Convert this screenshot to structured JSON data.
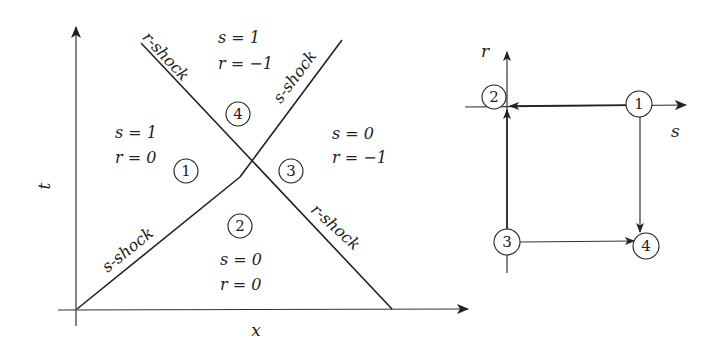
{
  "left_diagram": {
    "axes": {
      "x_label": "x",
      "y_label": "t"
    },
    "shocks": [
      {
        "label": "r-shock",
        "position": "upper-left"
      },
      {
        "label": "s-shock",
        "position": "upper-right"
      },
      {
        "label": "s-shock",
        "position": "lower-left"
      },
      {
        "label": "r-shock",
        "position": "lower-right"
      }
    ],
    "regions": [
      {
        "id": "1",
        "s": "s = 1",
        "r": "r = 0"
      },
      {
        "id": "2",
        "s": "s = 0",
        "r": "r = 0"
      },
      {
        "id": "3",
        "s": "s = 0",
        "r": "r = −1"
      },
      {
        "id": "4",
        "s": "s = 1",
        "r": "r = −1"
      }
    ]
  },
  "right_diagram": {
    "axes": {
      "x_label": "s",
      "y_label": "r"
    },
    "nodes": [
      "1",
      "2",
      "3",
      "4"
    ],
    "edges": [
      {
        "from": "1",
        "to": "2"
      },
      {
        "from": "1",
        "to": "4"
      },
      {
        "from": "3",
        "to": "2"
      },
      {
        "from": "3",
        "to": "4"
      }
    ]
  }
}
